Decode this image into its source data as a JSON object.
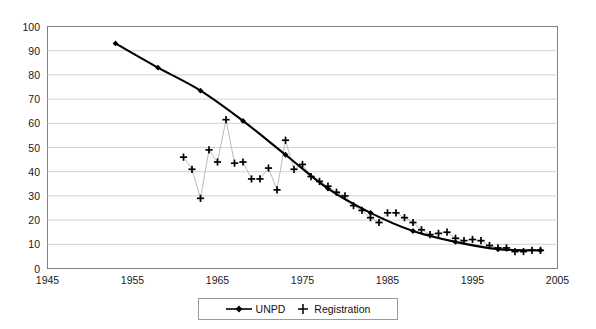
{
  "chart_data": {
    "type": "line",
    "title": "",
    "xlabel": "",
    "ylabel": "",
    "xlim": [
      1945,
      2005
    ],
    "ylim": [
      0,
      100
    ],
    "xticks": [
      1945,
      1955,
      1965,
      1975,
      1985,
      1995,
      2005
    ],
    "yticks": [
      0,
      10,
      20,
      30,
      40,
      50,
      60,
      70,
      80,
      90,
      100
    ],
    "grid": "horizontal",
    "legend_position": "bottom-center",
    "series": [
      {
        "name": "UNPD",
        "marker": "diamond",
        "line": "solid-thick",
        "color": "#000000",
        "x": [
          1953,
          1958,
          1963,
          1968,
          1973,
          1978,
          1983,
          1988,
          1993,
          1998,
          2003
        ],
        "values": [
          93,
          83,
          73.5,
          61,
          47,
          33,
          23,
          15.5,
          11,
          8,
          7.5
        ]
      },
      {
        "name": "Registration",
        "marker": "plus",
        "line": "thin-gray",
        "color": "#000000",
        "x": [
          1961,
          1962,
          1963,
          1964,
          1965,
          1966,
          1967,
          1968,
          1969,
          1970,
          1971,
          1972,
          1973,
          1974,
          1975,
          1976,
          1977,
          1978,
          1979,
          1980,
          1981,
          1982,
          1983,
          1984,
          1985,
          1986,
          1987,
          1988,
          1989,
          1990,
          1991,
          1992,
          1993,
          1994,
          1995,
          1996,
          1997,
          1998,
          1999,
          2000,
          2001,
          2002,
          2003
        ],
        "values": [
          46,
          41,
          29,
          49,
          44,
          61.5,
          43.5,
          44,
          37,
          37,
          41.5,
          32.5,
          53,
          41,
          43,
          38,
          36,
          34,
          31.5,
          30,
          26,
          24,
          21,
          19,
          23,
          23,
          21,
          19,
          16,
          14,
          14.5,
          15,
          12.5,
          11.5,
          12,
          11.5,
          9.5,
          8.5,
          8.5,
          7,
          7,
          7.5,
          7.5
        ]
      }
    ]
  },
  "legend": {
    "items": [
      {
        "label": "UNPD",
        "marker": "diamond-line"
      },
      {
        "label": "Registration",
        "marker": "plus"
      }
    ]
  },
  "axes": {
    "y_tick_labels": [
      "100",
      "90",
      "80",
      "70",
      "60",
      "50",
      "40",
      "30",
      "20",
      "10",
      "0"
    ],
    "x_tick_labels": [
      "1945",
      "1955",
      "1965",
      "1975",
      "1985",
      "1995",
      "2005"
    ]
  }
}
